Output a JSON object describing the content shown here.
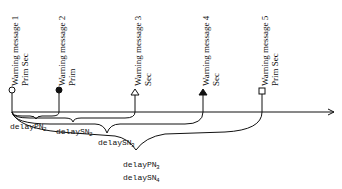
{
  "messages": [
    {
      "title": "Warning message 1",
      "type": "Prim Sec",
      "marker": "circle-open-icon"
    },
    {
      "title": "Warning message 2",
      "type": "Prim",
      "marker": "circle-filled-icon"
    },
    {
      "title": "Warning message 3",
      "type": "Sec",
      "marker": "triangle-open-icon"
    },
    {
      "title": "Warning message 4",
      "type": "Sec",
      "marker": "triangle-filled-icon"
    },
    {
      "title": "Warning message 5",
      "type": "Prim Sec",
      "marker": "square-open-icon"
    }
  ],
  "delays": [
    {
      "base": "delayPN",
      "sub": "2"
    },
    {
      "base": "delaySN",
      "sub": "2"
    },
    {
      "base": "delaySN",
      "sub": "3"
    },
    {
      "base": "delayPN",
      "sub": "3"
    },
    {
      "base": "delaySN",
      "sub": "4"
    }
  ]
}
